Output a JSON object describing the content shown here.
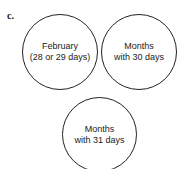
{
  "figure_label": "c.",
  "circles": [
    {
      "line1": "February",
      "line2": "(28 or 29 days)"
    },
    {
      "line1": "Months",
      "line2": "with 30 days"
    },
    {
      "line1": "Months",
      "line2": "with 31 days"
    }
  ]
}
